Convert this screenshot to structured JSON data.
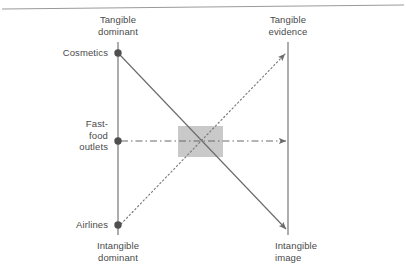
{
  "figure": {
    "background_color": "#ffffff",
    "line_color": "#6b6b6b",
    "text_color": "#4a4a4a",
    "highlight_color": "#c8c8c8"
  },
  "axes": {
    "left": {
      "top_label": "Tangible\ndominant",
      "bottom_label": "Intangible\ndominant",
      "x": 118,
      "y_top": 42,
      "y_bottom": 235
    },
    "right": {
      "top_label": "Tangible\nevidence",
      "bottom_label": "Intangible\nimage",
      "x": 288,
      "y_top": 42,
      "y_bottom": 235
    }
  },
  "points": [
    {
      "name": "cosmetics",
      "label": "Cosmetics",
      "x": 118,
      "y": 53
    },
    {
      "name": "fast-food",
      "label": "Fast-\nfood\noutlets",
      "x": 118,
      "y": 141
    },
    {
      "name": "airlines",
      "label": "Airlines",
      "x": 118,
      "y": 225
    }
  ],
  "connectors": [
    {
      "name": "cosmetics-to-intangible-image",
      "style": "solid",
      "from": "cosmetics",
      "to": "intangible-image",
      "x1": 120,
      "y1": 55,
      "x2": 286,
      "y2": 229,
      "arrowhead": "end"
    },
    {
      "name": "fast-food-to-right-axis",
      "style": "dash-dot",
      "from": "fast-food-outlets",
      "to": "right-axis-midpoint",
      "x1": 121,
      "y1": 141,
      "x2": 287,
      "y2": 141,
      "arrowhead": "end"
    },
    {
      "name": "airlines-to-tangible-evidence",
      "style": "dotted",
      "from": "airlines",
      "to": "tangible-evidence",
      "x1": 121,
      "y1": 224,
      "x2": 286,
      "y2": 53,
      "arrowhead": "end"
    }
  ],
  "highlight_box": {
    "name": "intersection-highlight",
    "x": 178,
    "y": 126,
    "width": 45,
    "height": 31,
    "color": "#c9c9c9"
  },
  "top_rule": {
    "name": "page-top-rule",
    "x1": 2,
    "y1": 9,
    "x2": 404,
    "y2": 5
  }
}
